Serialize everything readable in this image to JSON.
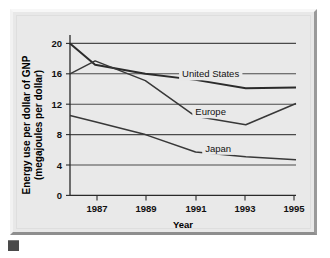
{
  "figure": {
    "corner_marker": "figure-marker"
  },
  "chart_data": {
    "type": "line",
    "title": "",
    "xlabel": "Year",
    "ylabel": "Energy use per dollar of GNP (megajoules per dollar)",
    "ylabel_line1": "Energy use per dollar of GNP",
    "ylabel_line2": "(megajoules per dollar)",
    "xlim": [
      1986,
      1995
    ],
    "ylim": [
      0,
      21
    ],
    "grid": "horizontal",
    "legend_position": "inline-labels",
    "xticks": [
      1987,
      1989,
      1991,
      1993,
      1995
    ],
    "xticklabels": [
      "1987",
      "1989",
      "1991",
      "1993",
      "1995"
    ],
    "yticks": [
      0,
      4,
      8,
      12,
      16,
      20
    ],
    "yticklabels": [
      "0",
      "4",
      "8",
      "12",
      "16",
      "20"
    ],
    "x": [
      1986,
      1987,
      1989,
      1991,
      1993,
      1995
    ],
    "series": [
      {
        "name": "United States",
        "label": "United States",
        "label_x": 1991.6,
        "label_y": 16.0,
        "values": [
          20.0,
          17.2,
          16.0,
          15.2,
          14.1,
          14.2
        ]
      },
      {
        "name": "Europe",
        "label": "Europe",
        "label_x": 1991.6,
        "label_y": 11.0,
        "values": [
          16.0,
          17.7,
          15.1,
          10.4,
          9.3,
          12.1
        ]
      },
      {
        "name": "Japan",
        "label": "Japan",
        "label_x": 1991.9,
        "label_y": 6.2,
        "values": [
          10.5,
          9.7,
          8.0,
          5.7,
          5.1,
          4.7
        ]
      }
    ]
  }
}
